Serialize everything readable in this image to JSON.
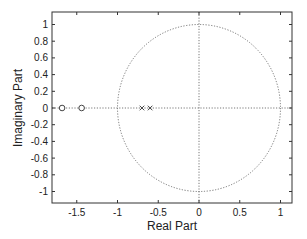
{
  "chart_data": {
    "type": "scatter",
    "title": "",
    "xlabel": "Real Part",
    "ylabel": "Imaginary Part",
    "xlim": [
      -1.8,
      1.15
    ],
    "ylim": [
      -1.15,
      1.15
    ],
    "grid": false,
    "legend": null,
    "x_ticks": [
      -1.5,
      -1,
      -0.5,
      0,
      0.5,
      1
    ],
    "x_tick_labels": [
      "-1.5",
      "-1",
      "-0.5",
      "0",
      "0.5",
      "1"
    ],
    "y_ticks": [
      1,
      0.8,
      0.6,
      0.4,
      0.2,
      0,
      -0.2,
      -0.4,
      -0.6,
      -0.8,
      -1
    ],
    "y_tick_labels": [
      "1",
      "0.8",
      "0.6",
      "0.4",
      "0.2",
      "0",
      "-0.2",
      "-0.4",
      "-0.6",
      "-0.8",
      "-1"
    ],
    "unit_circle": {
      "center": [
        0,
        0
      ],
      "radius": 1,
      "style": "dotted"
    },
    "reference_lines": [
      {
        "axis": "x",
        "value": 0,
        "style": "dotted"
      },
      {
        "axis": "y",
        "value": 0,
        "style": "dotted"
      }
    ],
    "series": [
      {
        "name": "zeros",
        "marker": "o",
        "points": [
          [
            -1.68,
            0
          ],
          [
            -1.44,
            0
          ]
        ]
      },
      {
        "name": "poles",
        "marker": "x",
        "points": [
          [
            -0.7,
            0
          ],
          [
            -0.6,
            0
          ]
        ]
      }
    ]
  }
}
